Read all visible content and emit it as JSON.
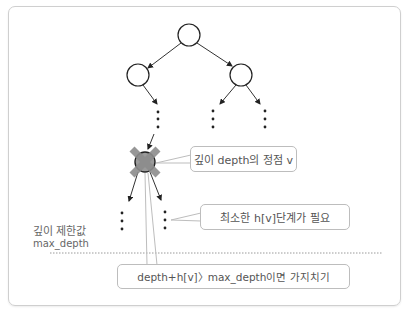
{
  "diagram": {
    "tree": {
      "nodes": [
        {
          "id": "root",
          "cx": 189,
          "cy": 35,
          "r": 11
        },
        {
          "id": "left",
          "cx": 138,
          "cy": 75,
          "r": 11
        },
        {
          "id": "right",
          "cx": 241,
          "cy": 75,
          "r": 11
        },
        {
          "id": "v",
          "cx": 145,
          "cy": 162,
          "r": 10,
          "pruned": true
        }
      ]
    },
    "callouts": {
      "node_v": "깊이 depth의 정점 v",
      "min_steps": "최소한 h[v]단계가 필요",
      "prune_rule": "depth+h[v]〉max_depth이면 가지치기"
    },
    "depth_limit": {
      "label_ko": "깊이 제한값",
      "label_var": "max_depth"
    },
    "colors": {
      "node_stroke": "#222222",
      "prune_mark": "#8c8c8c",
      "callout_border": "#bdbdbd",
      "dotted_line": "#9a9a9a"
    }
  }
}
